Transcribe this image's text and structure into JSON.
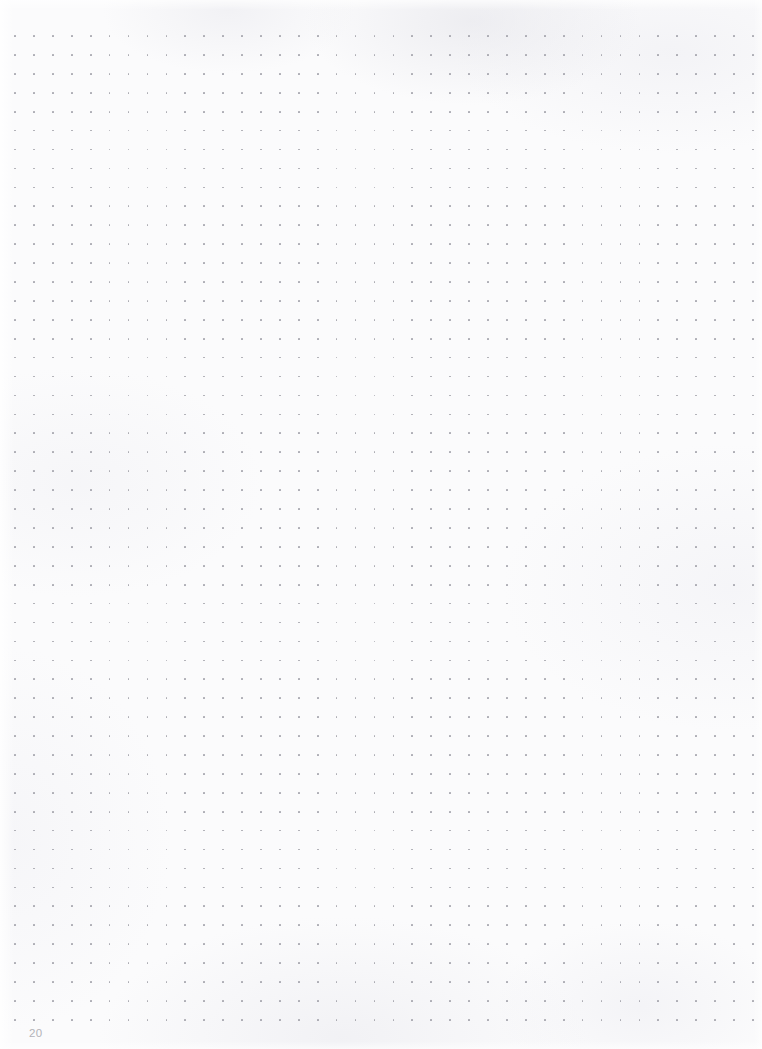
{
  "page": {
    "kind": "dotted-grid-notebook-page",
    "width": 762,
    "height": 1049,
    "background_color": "#fbfbfc",
    "page_number": "20",
    "page_number_color": "#b3b3b9",
    "content_text": ""
  },
  "grid": {
    "dot_color": "#9a9aa2",
    "dot_size_px": 1.7,
    "spacing_px": 18.92,
    "origin_x_px": 15,
    "origin_y_px": 36,
    "columns": 40,
    "rows": 53
  }
}
